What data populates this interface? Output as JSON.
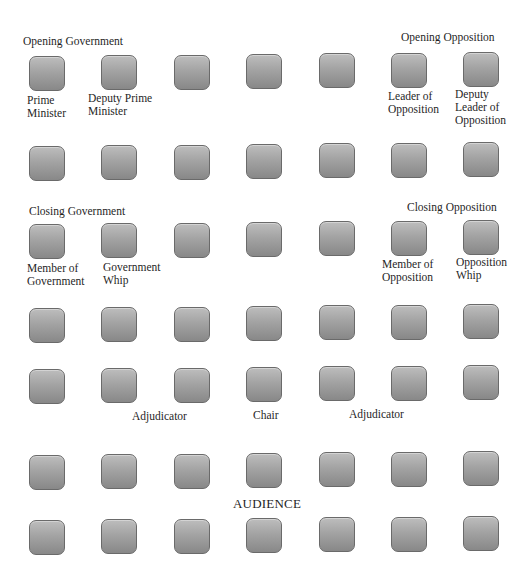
{
  "diagram": {
    "seat_rows": 7,
    "seat_columns": 7,
    "seat_color": "#a3a3a3",
    "teams": [
      {
        "id": "opening-government",
        "heading": "Opening Government",
        "roles": [
          "Prime\nMinister",
          "Deputy Prime\nMinister"
        ]
      },
      {
        "id": "opening-opposition",
        "heading": "Opening Opposition",
        "roles": [
          "Leader of\nOpposition",
          "Deputy\nLeader of\nOpposition"
        ]
      },
      {
        "id": "closing-government",
        "heading": "Closing Government",
        "roles": [
          "Member of\nGovernment",
          "Government\nWhip"
        ]
      },
      {
        "id": "closing-opposition",
        "heading": "Closing Opposition",
        "roles": [
          "Member of\nOpposition",
          "Opposition\nWhip"
        ]
      }
    ],
    "panel": {
      "left": "Adjudicator",
      "center": "Chair",
      "right": "Adjudicator"
    },
    "audience_label": "AUDIENCE"
  }
}
